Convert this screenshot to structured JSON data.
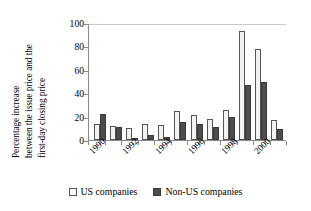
{
  "chart_data": {
    "type": "bar",
    "title": "",
    "subtitle": "",
    "xlabel": "",
    "ylabel": "Percentage increase between the issue price and the first-day closing price",
    "ylabel_lines": [
      "Percentage increase",
      "between the issue price and the",
      "first-day closing price"
    ],
    "ylim": [
      0,
      100
    ],
    "yticks": [
      0,
      20,
      40,
      60,
      80,
      100
    ],
    "ytick_labels": [
      "0",
      "20",
      "40",
      "60",
      "80",
      "100"
    ],
    "grid": "top-only",
    "legend_position": "bottom-center",
    "categories": [
      "1990",
      "1991",
      "1992",
      "1993",
      "1994",
      "1995",
      "1996",
      "1997",
      "1998",
      "1999",
      "2000",
      "2001"
    ],
    "xtick_labels_shown": [
      "1990",
      "1992",
      "1994",
      "1996",
      "1998",
      "2000"
    ],
    "series": [
      {
        "name": "US companies",
        "color": "#f2f2f2",
        "edge_color": "#555555",
        "values": [
          14,
          12,
          10,
          14,
          13,
          25,
          21,
          18,
          26,
          93,
          78,
          17
        ]
      },
      {
        "name": "Non-US companies",
        "color": "#4d4d4d",
        "edge_color": "#3a3a3a",
        "values": [
          22,
          11,
          0.5,
          4,
          3,
          15,
          14,
          11,
          20,
          47,
          50,
          9
        ]
      }
    ]
  },
  "legend": {
    "items": [
      {
        "label": "US companies",
        "swatch": "open-square"
      },
      {
        "label": "Non-US companies",
        "swatch": "filled-square"
      }
    ]
  }
}
